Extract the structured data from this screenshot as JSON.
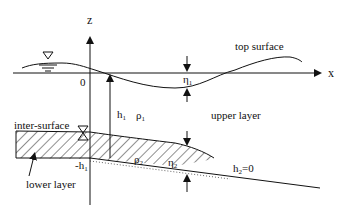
{
  "diagram": {
    "axes": {
      "z_label": "z",
      "x_label": "x",
      "origin_label": "0"
    },
    "labels": {
      "top_surface": "top surface",
      "upper_layer": "upper layer",
      "inter_surface": "inter-surface",
      "lower_layer": "lower layer",
      "h1": "h",
      "h1_sub": "1",
      "rho1": "ρ",
      "rho1_sub": "1",
      "rho2": "ρ",
      "rho2_sub": "2",
      "eta1": "η",
      "eta1_sub": "1",
      "eta2": "η",
      "eta2_sub": "2",
      "neg_h1": "-h",
      "neg_h1_sub": "1",
      "h2_zero": "h",
      "h2_zero_sub": "2",
      "h2_zero_eq": "=0"
    },
    "colors": {
      "line": "#111111",
      "background": "#ffffff"
    }
  }
}
